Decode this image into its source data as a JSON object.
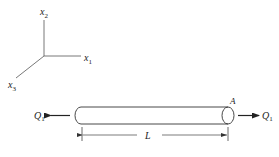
{
  "figure": {
    "axes": {
      "x1": {
        "label": "x",
        "subscript": "1"
      },
      "x2": {
        "label": "x",
        "subscript": "2"
      },
      "x3": {
        "label": "x",
        "subscript": "3"
      }
    },
    "bar": {
      "end_label": "A",
      "length_label": "L"
    },
    "loads": {
      "left": {
        "label": "Q",
        "subscript": "1",
        "direction": "left"
      },
      "right": {
        "label": "Q",
        "subscript": "1",
        "direction": "right"
      }
    },
    "colors": {
      "line": "#333333",
      "background": "#ffffff"
    }
  }
}
